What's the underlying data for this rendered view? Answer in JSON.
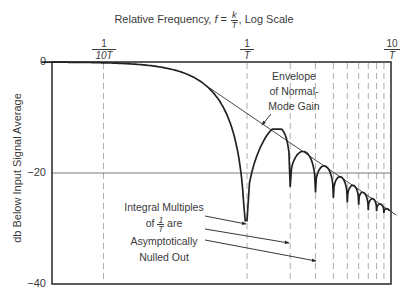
{
  "chart_data": {
    "type": "line",
    "xlabel": "Relative Frequency, f = k/T, Log Scale",
    "ylabel": "db Below Input Signal Average",
    "x_scale": "log",
    "x_ticks": [
      "1/10T",
      "1/T",
      "10/T"
    ],
    "x_range": [
      "~0.037/T",
      "10/T"
    ],
    "y_ticks": [
      0,
      -20,
      -40
    ],
    "ylim": [
      -40,
      0
    ],
    "grid": {
      "horizontal": [
        -20
      ],
      "vertical_dashed": [
        "1/10T",
        "1/T",
        "2/T",
        "3/T",
        "4/T",
        "5/T",
        "6/T",
        "7/T",
        "8/T",
        "9/T"
      ]
    },
    "series": [
      {
        "name": "Normal-Mode Gain",
        "description": "sinc-shaped response: main lobe from 0 dB, nulls at integer multiples of 1/T",
        "nulls": [
          {
            "f": "1/T",
            "db": -28.6
          },
          {
            "f": "2/T",
            "db": -22.5
          },
          {
            "f": "3/T",
            "db": -23.5
          },
          {
            "f": "4/T",
            "db": -24.5
          },
          {
            "f": "5/T",
            "db": -25.3
          },
          {
            "f": "6/T",
            "db": -25.7
          },
          {
            "f": "7/T",
            "db": -26.7
          },
          {
            "f": "8/T",
            "db": -26.9
          },
          {
            "f": "9/T",
            "db": -27.2
          }
        ],
        "points": [
          {
            "f_T": 0.1,
            "db": 0
          },
          {
            "f_T": 0.2,
            "db": -0.5
          },
          {
            "f_T": 0.4,
            "db": -2.5
          },
          {
            "f_T": 0.6,
            "db": -6.5
          },
          {
            "f_T": 0.8,
            "db": -13
          },
          {
            "f_T": 1.0,
            "db": -28.6
          },
          {
            "f_T": 1.43,
            "db": -13.1
          },
          {
            "f_T": 2.0,
            "db": -22.5
          },
          {
            "f_T": 2.46,
            "db": -17.5
          },
          {
            "f_T": 3.47,
            "db": -20.5
          },
          {
            "f_T": 4.48,
            "db": -22.2
          },
          {
            "f_T": 5.48,
            "db": -23.6
          },
          {
            "f_T": 6.49,
            "db": -24.6
          },
          {
            "f_T": 7.49,
            "db": -25.4
          },
          {
            "f_T": 8.49,
            "db": -26.1
          },
          {
            "f_T": 9.5,
            "db": -26.6
          }
        ]
      },
      {
        "name": "Envelope of Normal-Mode Gain",
        "type": "straight line",
        "points": [
          {
            "f_T": 0.55,
            "db": -4.7
          },
          {
            "f_T": 11,
            "db": -27.6
          }
        ]
      }
    ],
    "annotations": [
      "Envelope of Normal-Mode Gain",
      "Integral Multiples of 1/T are Asymptotically Nulled Out"
    ]
  },
  "labels": {
    "title_prefix": "Relative Frequency,",
    "title_f": "f",
    "title_eq": "=",
    "title_num": "k",
    "title_den": "T",
    "title_suffix": ", Log Scale",
    "xtick_1_num": "1",
    "xtick_1_den": "10T",
    "xtick_2_num": "1",
    "xtick_2_den": "T",
    "xtick_3_num": "10",
    "xtick_3_den": "T",
    "ytick_0": "0",
    "ytick_20": "−20",
    "ytick_40": "−40",
    "ylabel": "db Below Input Signal Average",
    "envelope_line1": "Envelope",
    "envelope_line2": "of Normal-",
    "envelope_line3": "Mode Gain",
    "nulls_line1": "Integral Multiples",
    "nulls_of": "of",
    "nulls_num": "1",
    "nulls_den": "T",
    "nulls_are": "are",
    "nulls_line3": "Asymptotically",
    "nulls_line4": "Nulled Out"
  },
  "colors": {
    "curve": "#222222",
    "axis": "#333333",
    "grid": "#aaaaaa",
    "text": "#3a3a3a"
  }
}
